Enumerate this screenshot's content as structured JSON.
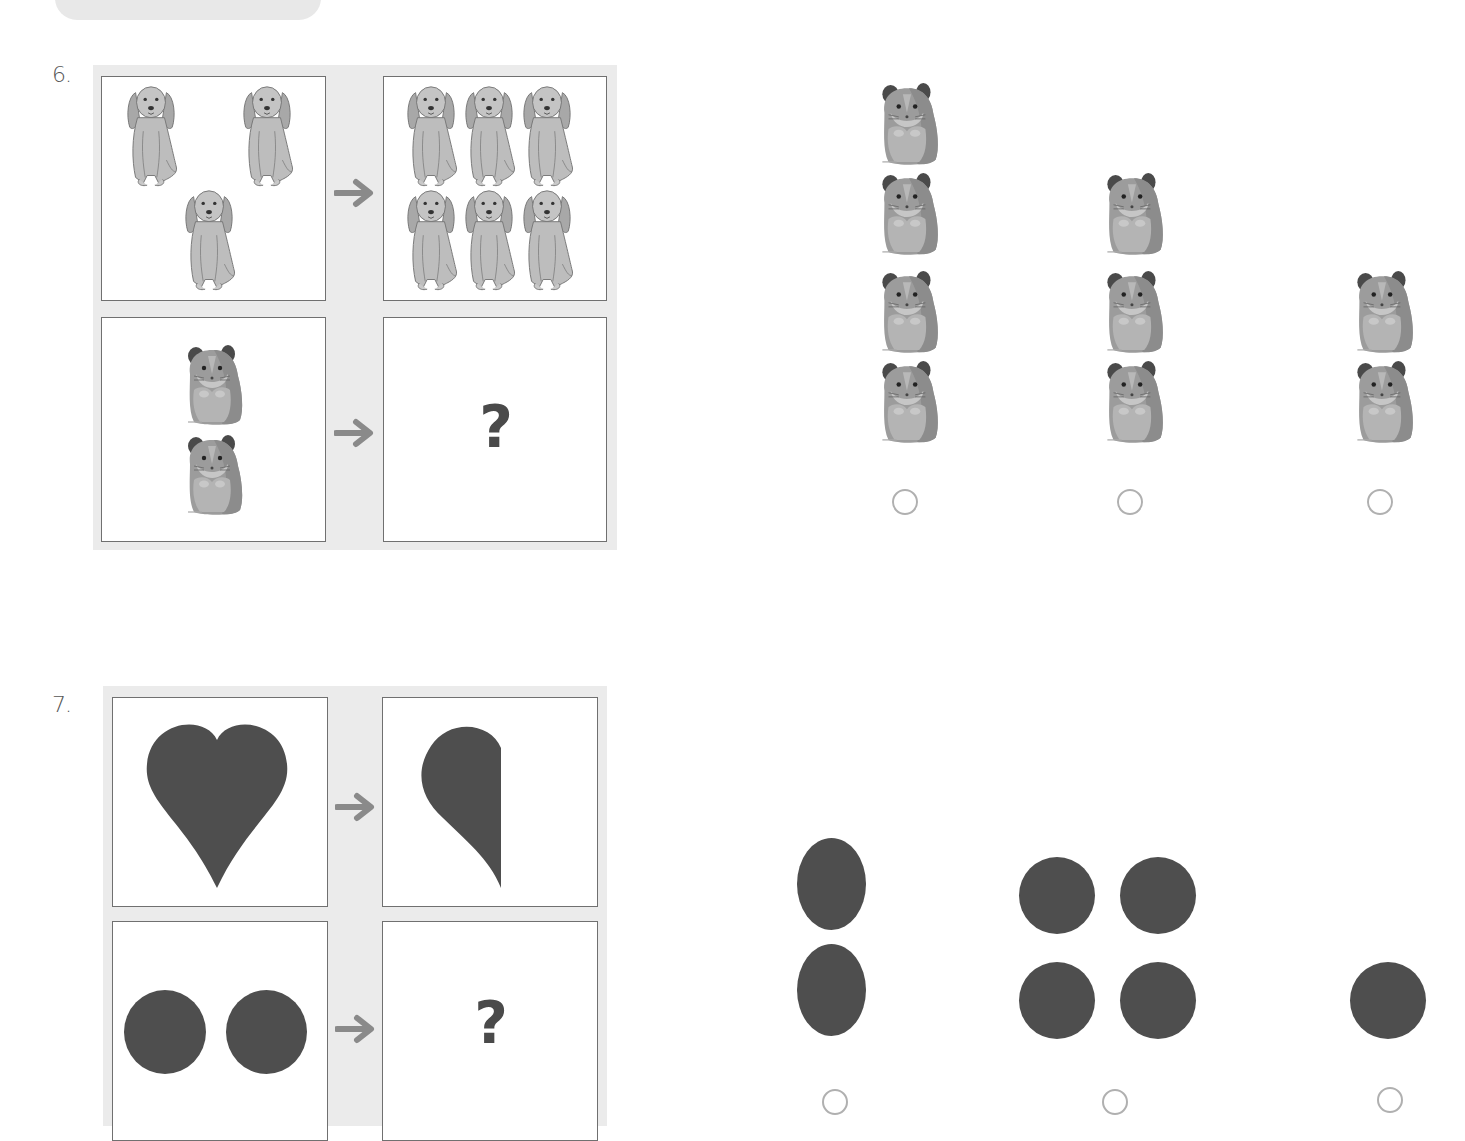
{
  "header": {
    "tab_label": ""
  },
  "questions": [
    {
      "number": "6.",
      "pattern": {
        "top_left": {
          "item": "dog",
          "count": 3
        },
        "top_right": {
          "item": "dog",
          "count": 6
        },
        "bottom_left": {
          "item": "hamster",
          "count": 2
        },
        "bottom_right": {
          "text": "?"
        }
      },
      "arrow_icon": "arrow-right-icon",
      "options": [
        {
          "item": "hamster",
          "count": 4,
          "selected": false
        },
        {
          "item": "hamster",
          "count": 3,
          "selected": false
        },
        {
          "item": "hamster",
          "count": 2,
          "selected": false
        }
      ]
    },
    {
      "number": "7.",
      "pattern": {
        "top_left": {
          "item": "heart",
          "count": 1
        },
        "top_right": {
          "item": "half-heart",
          "count": 1
        },
        "bottom_left": {
          "item": "circle",
          "count": 2
        },
        "bottom_right": {
          "text": "?"
        }
      },
      "arrow_icon": "arrow-right-icon",
      "options": [
        {
          "item": "oval",
          "count": 2,
          "selected": false
        },
        {
          "item": "circle",
          "count": 4,
          "selected": false
        },
        {
          "item": "circle",
          "count": 1,
          "selected": false
        }
      ]
    }
  ],
  "colors": {
    "panel": "#ebebeb",
    "cell_border": "#707070",
    "shape_fill": "#4e4e4e",
    "arrow": "#8a8a8a",
    "radio_border": "#b0b0b0"
  }
}
